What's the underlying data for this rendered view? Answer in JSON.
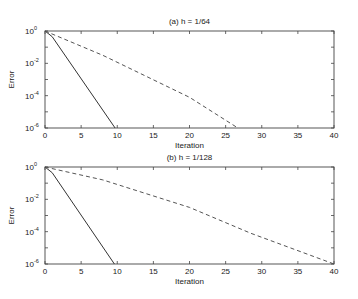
{
  "chart_data": [
    {
      "type": "line",
      "title": "(a)  h = 1/64",
      "xlabel": "Iteration",
      "ylabel": "Error",
      "xlim": [
        0,
        40
      ],
      "ylim_log10": [
        -6,
        0
      ],
      "yscale": "log",
      "xticks": [
        0,
        5,
        10,
        15,
        20,
        25,
        30,
        35,
        40
      ],
      "yticks": [
        {
          "exp": "0",
          "value": 1
        },
        {
          "exp": "-2",
          "value": 0.01
        },
        {
          "exp": "-4",
          "value": 0.0001
        },
        {
          "exp": "-6",
          "value": 1e-06
        }
      ],
      "grid": false,
      "series": [
        {
          "name": "solid",
          "style": "solid",
          "x": [
            0,
            1,
            9.7
          ],
          "log10_y": [
            0,
            -0.35,
            -6
          ]
        },
        {
          "name": "dashed",
          "style": "dashed",
          "x": [
            0,
            8,
            20,
            26.7
          ],
          "log10_y": [
            0,
            -1.5,
            -4.1,
            -6
          ]
        }
      ]
    },
    {
      "type": "line",
      "title": "(b)  h = 1/128",
      "xlabel": "Iteration",
      "ylabel": "Error",
      "xlim": [
        0,
        40
      ],
      "ylim_log10": [
        -6,
        0
      ],
      "yscale": "log",
      "xticks": [
        0,
        5,
        10,
        15,
        20,
        25,
        30,
        35,
        40
      ],
      "yticks": [
        {
          "exp": "0",
          "value": 1
        },
        {
          "exp": "-2",
          "value": 0.01
        },
        {
          "exp": "-4",
          "value": 0.0001
        },
        {
          "exp": "-6",
          "value": 1e-06
        }
      ],
      "grid": false,
      "series": [
        {
          "name": "solid",
          "style": "solid",
          "x": [
            0,
            1,
            9.6
          ],
          "log10_y": [
            0,
            -0.35,
            -6
          ]
        },
        {
          "name": "dashed",
          "style": "dashed",
          "x": [
            0,
            8,
            20,
            28.5,
            40
          ],
          "log10_y": [
            0,
            -0.8,
            -2.5,
            -4.1,
            -6
          ]
        }
      ]
    }
  ]
}
